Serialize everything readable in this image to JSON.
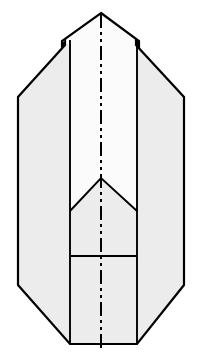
{
  "figure": {
    "name": "sheet-metal-flat-pattern",
    "canvas": {
      "width": 200,
      "height": 360,
      "background": "#ffffff"
    },
    "style": {
      "outline_color": "#000000",
      "outline_width": 2.2,
      "fold_line_color": "#000000",
      "fold_line_width": 1.9,
      "center_line_color": "#000000",
      "center_line_width": 2.0,
      "fill_panel_side": "#ececec",
      "fill_panel_center_upper": "#fbfbfb",
      "fill_panel_center_mid": "#ececec",
      "fill_panel_center_lower": "#ececec"
    },
    "center_line": {
      "name": "vertical-center-line",
      "x": 101,
      "y_top": 14,
      "y_bottom": 352,
      "dash_pattern": "14,4,3,4,3,4"
    },
    "outline_path": "M 101,13 L 139,41 L 139,45 L 136,42 L 136,45 L 184,97 L 184,285 L 137,344 L 70,344 L 18,285 L 18,97 L 65,45 L 65,42 L 62,45 L 62,41 Z",
    "panels": [
      {
        "name": "left-wing-panel",
        "fill": "#ececec",
        "path": "M 62,41 L 62,45 L 65,42 L 65,45 L 18,97 L 18,285 L 70,344 L 70,45 Z"
      },
      {
        "name": "right-wing-panel",
        "fill": "#ececec",
        "path": "M 139,41 L 139,45 L 136,42 L 136,45 L 184,97 L 184,285 L 137,344 L 137,45 Z"
      },
      {
        "name": "center-upper-panel",
        "fill": "#fbfbfb",
        "path": "M 101,13 L 137,40 L 137,211 L 101,178 L 70,211 L 70,40 Z"
      },
      {
        "name": "center-mid-panel",
        "fill": "#ececec",
        "path": "M 101,178 L 137,211 L 137,256 L 70,256 L 70,211 Z"
      },
      {
        "name": "center-lower-panel",
        "fill": "#ececec",
        "path": "M 70,256 L 137,256 L 137,344 L 70,344 Z"
      }
    ],
    "fold_lines": [
      {
        "name": "fold-line-left-vertical",
        "path": "M 70,40 L 70,344"
      },
      {
        "name": "fold-line-right-vertical",
        "path": "M 137,40 L 137,344"
      },
      {
        "name": "fold-line-chevron",
        "path": "M 70,211 L 101,178 L 137,211"
      },
      {
        "name": "fold-line-horizontal",
        "path": "M 70,256 L 137,256"
      }
    ],
    "vertices": {
      "apex_top": [
        101,
        13
      ],
      "notch_left_outer": [
        62,
        41
      ],
      "notch_left_inner": [
        65,
        45
      ],
      "notch_right_outer": [
        139,
        41
      ],
      "notch_right_inner": [
        136,
        45
      ],
      "left_shoulder": [
        18,
        97
      ],
      "right_shoulder": [
        184,
        97
      ],
      "left_hip": [
        18,
        285
      ],
      "right_hip": [
        184,
        285
      ],
      "bottom_left": [
        70,
        344
      ],
      "bottom_right": [
        137,
        344
      ],
      "chevron_apex": [
        101,
        178
      ],
      "chevron_left_end": [
        70,
        211
      ],
      "chevron_right_end": [
        137,
        211
      ],
      "horizontal_fold_left": [
        70,
        256
      ],
      "horizontal_fold_right": [
        137,
        256
      ]
    }
  }
}
